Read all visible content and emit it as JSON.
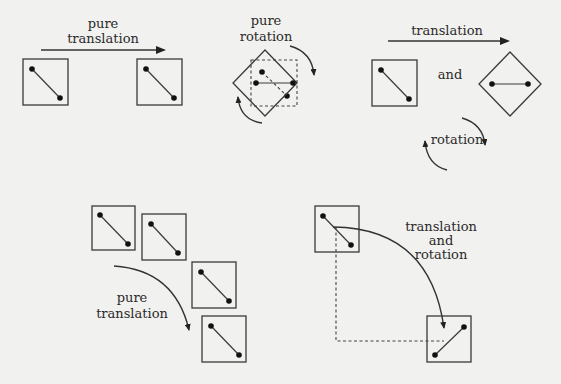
{
  "labels": {
    "panel1_line1": "pure",
    "panel1_line2": "translation",
    "panel2_line1": "pure",
    "panel2_line2": "rotation",
    "panel3_top": "translation",
    "panel3_mid": "and",
    "panel3_bottom": "rotation",
    "panel4_line1": "pure",
    "panel4_line2": "translation",
    "panel5_line1": "translation",
    "panel5_line2": "and",
    "panel5_line3": "rotation"
  },
  "colors": {
    "background": "#f1f1ef",
    "ink": "#333333",
    "dot": "#111111"
  }
}
